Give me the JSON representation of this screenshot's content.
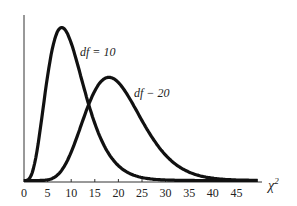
{
  "chart_data": {
    "type": "line",
    "title": "",
    "xlabel": "χ²",
    "ylabel": "",
    "xlim": [
      0,
      50
    ],
    "grid": false,
    "x_ticks": [
      0,
      5,
      10,
      15,
      20,
      25,
      30,
      35,
      40,
      45
    ],
    "x_tick_labels": [
      "0",
      "5",
      "10",
      "15",
      "20",
      "25",
      "30",
      "35",
      "40",
      "45"
    ],
    "series": [
      {
        "name": "df = 10",
        "label": "df = 10",
        "peak_x": 8,
        "distribution": "chi-square",
        "df": 10
      },
      {
        "name": "df = 20",
        "label": "df − 20",
        "peak_x": 18,
        "distribution": "chi-square",
        "df": 20
      }
    ],
    "annotations": [
      "df = 10",
      "df − 20"
    ]
  },
  "labels": {
    "curve1": "df = 10",
    "curve2": "df − 20",
    "x_axis_title": "χ",
    "x_axis_sup": "2"
  }
}
